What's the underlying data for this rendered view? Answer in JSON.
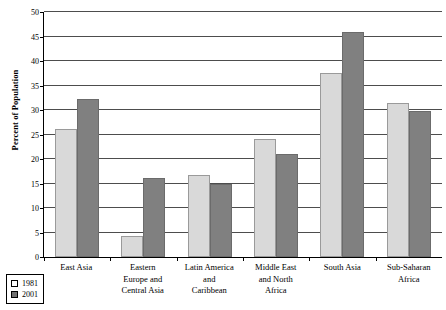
{
  "chart_data": {
    "type": "bar",
    "title": "",
    "xlabel": "",
    "ylabel": "Percent of Population",
    "ylim": [
      0,
      50
    ],
    "ytick_step": 5,
    "yticks": [
      "0",
      "5",
      "10",
      "15",
      "20",
      "25",
      "30",
      "35",
      "40",
      "45",
      "50"
    ],
    "grid": true,
    "legend_position": "bottom-left",
    "categories": [
      "East Asia",
      "Eastern Europe and Central Asia",
      "Latin America and Caribbean",
      "Middle East and North Africa",
      "South Asia",
      "Sub-Saharan Africa"
    ],
    "series": [
      {
        "name": "1981",
        "color": "#d9d9d9",
        "values": [
          26.2,
          4.3,
          16.7,
          24.0,
          37.5,
          31.5
        ]
      },
      {
        "name": "2001",
        "color": "#808080",
        "values": [
          32.2,
          16.2,
          15.0,
          21.0,
          46.0,
          29.8
        ]
      }
    ]
  },
  "axis": {
    "y_title": "Percent of Population"
  },
  "legend": {
    "items": [
      {
        "label": "1981"
      },
      {
        "label": "2001"
      }
    ]
  },
  "category_lines": [
    [
      "East Asia"
    ],
    [
      "Eastern",
      "Europe and",
      "Central Asia"
    ],
    [
      "Latin America",
      "and",
      "Caribbean"
    ],
    [
      "Middle East",
      "and North",
      "Africa"
    ],
    [
      "South Asia"
    ],
    [
      "Sub-Saharan",
      "Africa"
    ]
  ]
}
